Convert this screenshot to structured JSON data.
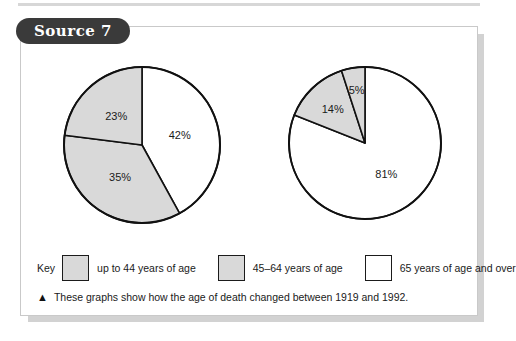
{
  "badge": {
    "label": "Source 7"
  },
  "legend": {
    "title": "Key",
    "items": [
      {
        "label": "up to 44 years of age",
        "swatch": "gray",
        "color": "#d9d9d9"
      },
      {
        "label": "45–64 years of age",
        "swatch": "gray",
        "color": "#d9d9d9"
      },
      {
        "label": "65 years of age and over",
        "swatch": "white",
        "color": "#ffffff"
      }
    ]
  },
  "caption": {
    "marker": "▲",
    "text": "These graphs show how the age of death changed between 1919 and 1992."
  },
  "chart_data": [
    {
      "type": "pie",
      "title": "1919",
      "categories": [
        "65 years of age and over",
        "up to 44 years of age",
        "45–64 years of age"
      ],
      "values": [
        42,
        35,
        23
      ],
      "labels": [
        "42%",
        "35%",
        "23%"
      ],
      "colors": [
        "#ffffff",
        "#d9d9d9",
        "#d9d9d9"
      ],
      "start_angle_deg": 0,
      "direction": "clockwise",
      "stroke": "#111111",
      "legend_position": "bottom"
    },
    {
      "type": "pie",
      "title": "1992",
      "categories": [
        "65 years of age and over",
        "45–64 years of age",
        "up to 44 years of age"
      ],
      "values": [
        81,
        14,
        5
      ],
      "labels": [
        "81%",
        "14%",
        "5%"
      ],
      "colors": [
        "#ffffff",
        "#d9d9d9",
        "#d9d9d9"
      ],
      "start_angle_deg": 0,
      "direction": "clockwise",
      "stroke": "#111111",
      "legend_position": "bottom"
    }
  ]
}
